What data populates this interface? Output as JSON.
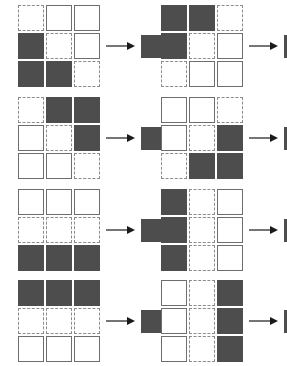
{
  "page": {
    "background_color": "#ffffff",
    "width": 287,
    "height": 366,
    "layout": "2 columns x 4 rows of puzzles"
  },
  "legend": {
    "cell_states": [
      "dashed",
      "solid",
      "filled"
    ],
    "dashed_label": "empty dashed-outline square",
    "solid_label": "empty solid-outline square",
    "filled_label": "dark filled square",
    "colors": {
      "filled": "#4d4d4d",
      "solid_border": "#6e6e6e",
      "dashed_border": "#8c8c8c",
      "cell_background": "#ffffff",
      "arrow": "#1a1a1a"
    }
  },
  "arrow": {
    "icon": "arrow-right-icon",
    "label": "implies"
  },
  "puzzles": [
    {
      "id": "puzzle-1",
      "position": "row1-left",
      "rows": [
        [
          "dashed",
          "solid",
          "solid"
        ],
        [
          "filled",
          "dashed",
          "solid"
        ],
        [
          "filled",
          "filled",
          "dashed"
        ]
      ],
      "result": "filled"
    },
    {
      "id": "puzzle-2",
      "position": "row1-right",
      "rows": [
        [
          "filled",
          "filled",
          "dashed"
        ],
        [
          "filled",
          "dashed",
          "solid"
        ],
        [
          "dashed",
          "solid",
          "solid"
        ]
      ],
      "result": "filled"
    },
    {
      "id": "puzzle-3",
      "position": "row2-left",
      "rows": [
        [
          "dashed",
          "filled",
          "filled"
        ],
        [
          "solid",
          "dashed",
          "filled"
        ],
        [
          "solid",
          "solid",
          "dashed"
        ]
      ],
      "result": "filled"
    },
    {
      "id": "puzzle-4",
      "position": "row2-right",
      "rows": [
        [
          "solid",
          "solid",
          "dashed"
        ],
        [
          "solid",
          "dashed",
          "filled"
        ],
        [
          "dashed",
          "filled",
          "filled"
        ]
      ],
      "result": "filled"
    },
    {
      "id": "puzzle-5",
      "position": "row3-left",
      "rows": [
        [
          "solid",
          "solid",
          "solid"
        ],
        [
          "dashed",
          "dashed",
          "dashed"
        ],
        [
          "filled",
          "filled",
          "filled"
        ]
      ],
      "result": "filled"
    },
    {
      "id": "puzzle-6",
      "position": "row3-right",
      "rows": [
        [
          "filled",
          "dashed",
          "solid"
        ],
        [
          "filled",
          "dashed",
          "solid"
        ],
        [
          "filled",
          "dashed",
          "solid"
        ]
      ],
      "result": "filled"
    },
    {
      "id": "puzzle-7",
      "position": "row4-left",
      "rows": [
        [
          "filled",
          "filled",
          "filled"
        ],
        [
          "dashed",
          "dashed",
          "dashed"
        ],
        [
          "solid",
          "solid",
          "solid"
        ]
      ],
      "result": "filled"
    },
    {
      "id": "puzzle-8",
      "position": "row4-right",
      "rows": [
        [
          "solid",
          "dashed",
          "filled"
        ],
        [
          "solid",
          "dashed",
          "filled"
        ],
        [
          "solid",
          "dashed",
          "filled"
        ]
      ],
      "result": "filled"
    }
  ]
}
